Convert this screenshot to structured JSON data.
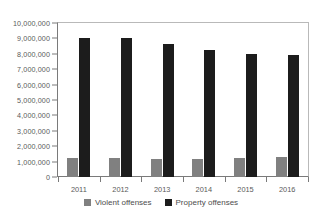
{
  "chart_data": {
    "type": "bar",
    "title": "",
    "xlabel": "",
    "ylabel": "",
    "categories": [
      "2011",
      "2012",
      "2013",
      "2014",
      "2015",
      "2016"
    ],
    "series": [
      {
        "name": "Violent offenses",
        "color": "#808080",
        "values": [
          1210000,
          1220000,
          1170000,
          1200000,
          1230000,
          1280000
        ]
      },
      {
        "name": "Property offenses",
        "color": "#1c1c1c",
        "values": [
          9050000,
          9000000,
          8650000,
          8280000,
          8020000,
          7920000
        ]
      }
    ],
    "ylim": [
      0,
      10000000
    ],
    "ytick_values": [
      0,
      1000000,
      2000000,
      3000000,
      4000000,
      5000000,
      6000000,
      7000000,
      8000000,
      9000000,
      10000000
    ],
    "ytick_labels": [
      "0",
      "1,000,000",
      "2,000,000",
      "3,000,000",
      "4,000,000",
      "5,000,000",
      "6,000,000",
      "7,000,000",
      "8,000,000",
      "9,000,000",
      "10,000,000"
    ],
    "grid": false,
    "legend_position": "bottom"
  }
}
